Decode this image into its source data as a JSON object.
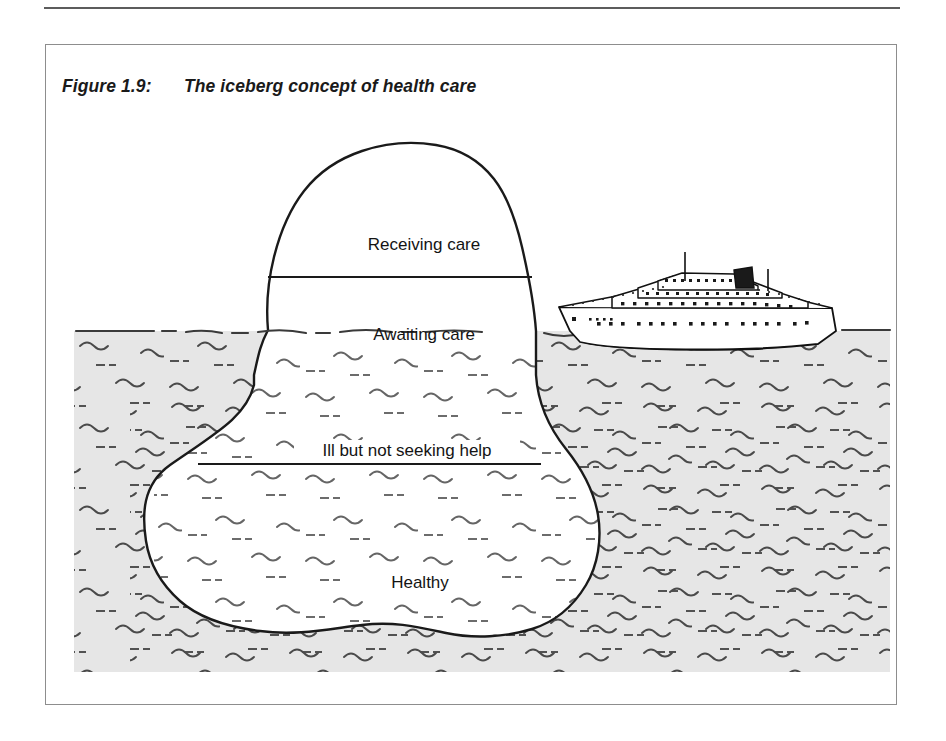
{
  "figure": {
    "number": "Figure 1.9:",
    "title": "The iceberg concept of health care"
  },
  "diagram": {
    "type": "conceptual-iceberg",
    "waterline_y": 330,
    "labels": [
      {
        "id": "receiving-care",
        "text": "Receiving care",
        "position": "above-water-top",
        "x": 378,
        "y": 205
      },
      {
        "id": "awaiting-care",
        "text": "Awaiting care",
        "position": "above-water-bottom",
        "x": 378,
        "y": 295
      },
      {
        "id": "ill-not-seeking",
        "text": "Ill but not seeking help",
        "position": "below-water-upper",
        "x": 360,
        "y": 411
      },
      {
        "id": "healthy",
        "text": "Healthy",
        "position": "below-water-lower",
        "x": 372,
        "y": 543
      }
    ],
    "ship": {
      "name": "ocean-liner",
      "x": 562,
      "y": 268
    },
    "colors": {
      "water": "#e6e6e6",
      "ice": "#ffffff",
      "outline": "#1a1a1a",
      "squiggle": "#4a4a4a",
      "frame": "#8d8d8d",
      "rule": "#5c5c5c",
      "text": "#141414"
    }
  }
}
